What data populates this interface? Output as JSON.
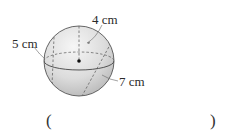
{
  "figure": {
    "shape": "sphere",
    "labels": {
      "top": "4 cm",
      "left": "5 cm",
      "right": "7 cm"
    },
    "colors": {
      "outline": "#555555",
      "fill_light": "#f2f2f2",
      "fill_dark": "#c4c4c4",
      "text": "#2a2a2a"
    }
  },
  "answer": {
    "open_paren": "(",
    "close_paren": ")",
    "value": ""
  }
}
